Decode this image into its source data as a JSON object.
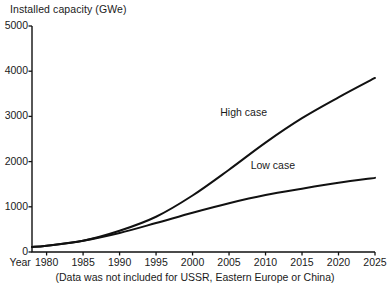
{
  "chart_data": {
    "type": "line",
    "title": "Installed capacity (GWe)",
    "xlabel": "Year",
    "ylabel": "Installed capacity (GWe)",
    "footnote": "(Data was not included for USSR, Eastern Europe or China)",
    "grid": false,
    "legend_position": "inline-at-curve-end",
    "xlim": [
      1978,
      2025
    ],
    "ylim": [
      0,
      5000
    ],
    "x_ticks": [
      1980,
      1985,
      1990,
      1995,
      2000,
      2005,
      2010,
      2015,
      2020,
      2025
    ],
    "x_tick_labels": [
      "1980",
      "1985",
      "1990",
      "1995",
      "2000",
      "2005",
      "2010",
      "2015",
      "2020",
      "2025"
    ],
    "y_ticks": [
      0,
      1000,
      2000,
      3000,
      4000,
      5000
    ],
    "y_tick_labels": [
      "0",
      "1000",
      "2000",
      "3000",
      "4000",
      "5000"
    ],
    "x": [
      1978,
      1980,
      1985,
      1990,
      1995,
      2000,
      2005,
      2010,
      2015,
      2020,
      2025
    ],
    "series": [
      {
        "name": "High case",
        "label": "High case",
        "color": "#111111",
        "values": [
          110,
          140,
          250,
          470,
          780,
          1250,
          1820,
          2420,
          2960,
          3420,
          3850
        ]
      },
      {
        "name": "Low case",
        "label": "Low case",
        "color": "#111111",
        "values": [
          110,
          140,
          250,
          420,
          640,
          870,
          1080,
          1260,
          1400,
          1530,
          1640
        ]
      }
    ],
    "annotations": [
      {
        "text": "High case",
        "x": 2007,
        "y": 3080
      },
      {
        "text": "Low case",
        "x": 2011,
        "y": 1900
      }
    ],
    "axis_color": "#111111",
    "line_width": 2
  }
}
